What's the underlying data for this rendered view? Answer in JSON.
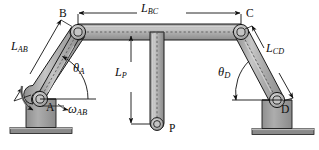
{
  "figure": {
    "type": "mechanism-diagram",
    "width": 319,
    "height": 150,
    "background": "#ffffff"
  },
  "colors": {
    "link_fill": "#a9a9a9",
    "link_highlight": "#c9c9c9",
    "link_stroke": "#1a1a1a",
    "ground_fill": "#9e9e9e",
    "ground_base": "#8a8a8a",
    "centerline": "#6b6b6b",
    "text": "#0d0d0d",
    "pin_fill": "#b5b5b5",
    "pin_inner": "#cfcfcf"
  },
  "labels": {
    "joint_a": "A",
    "joint_b": "B",
    "joint_c": "C",
    "joint_d": "D",
    "joint_p": "P",
    "length_ab": "L",
    "length_ab_sub": "AB",
    "length_bc": "L",
    "length_bc_sub": "BC",
    "length_cd": "L",
    "length_cd_sub": "CD",
    "length_p": "L",
    "length_p_sub": "P",
    "angle_a": "θ",
    "angle_a_sub": "A",
    "angle_d": "θ",
    "angle_d_sub": "D",
    "omega_ab": "ω",
    "omega_ab_sub": "AB"
  },
  "geometry": {
    "joints": [
      {
        "name": "A",
        "x": 40,
        "y": 99,
        "type": "ground-pin",
        "radius": 7.5
      },
      {
        "name": "B",
        "x": 78,
        "y": 32,
        "type": "pin",
        "radius": 7.5
      },
      {
        "name": "C",
        "x": 241,
        "y": 32,
        "type": "pin",
        "radius": 7.5
      },
      {
        "name": "D",
        "x": 277,
        "y": 100,
        "type": "ground-pin",
        "radius": 7.5
      },
      {
        "name": "P",
        "x": 157,
        "y": 130,
        "type": "point",
        "radius": 6.5
      }
    ],
    "links": [
      {
        "name": "AB",
        "from": "A",
        "to": "B",
        "half_width": 8
      },
      {
        "name": "BC",
        "from": "B",
        "to": "C",
        "half_width": 8
      },
      {
        "name": "CD",
        "from": "C",
        "to": "D",
        "half_width": 8
      },
      {
        "name": "BP",
        "from": "BC-midpoint",
        "to": "P",
        "half_width": 7
      }
    ],
    "grounds": [
      {
        "name": "ground-A",
        "x": 26,
        "y": 99,
        "width": 30,
        "height": 30
      },
      {
        "name": "ground-D",
        "x": 262,
        "y": 100,
        "width": 30,
        "height": 30
      }
    ],
    "floors": [
      {
        "name": "floor-left",
        "x": 10,
        "y": 128,
        "width": 62,
        "height": 6
      },
      {
        "name": "floor-right",
        "x": 252,
        "y": 129,
        "width": 62,
        "height": 6
      }
    ],
    "dimensions": [
      {
        "name": "L_BC",
        "orientation": "horizontal",
        "x1": 78,
        "x2": 241,
        "y": 13
      },
      {
        "name": "L_P",
        "orientation": "vertical",
        "x": 131,
        "y1": 36,
        "y2": 130
      },
      {
        "name": "L_AB",
        "orientation": "diagonal",
        "x1": 20,
        "y1": 80,
        "x2": 62,
        "y2": 18
      },
      {
        "name": "L_CD",
        "orientation": "diagonal",
        "x1": 253,
        "y1": 25,
        "x2": 294,
        "y2": 88
      }
    ],
    "angles": [
      {
        "name": "theta_A",
        "vertex": "A",
        "radius": 30,
        "label_x": 75,
        "label_y": 72
      },
      {
        "name": "theta_D",
        "vertex": "D",
        "radius": 30,
        "label_x": 223,
        "label_y": 73
      },
      {
        "name": "omega_AB",
        "vertex": "A",
        "kind": "rotation-arrow",
        "direction": "counterclockwise"
      }
    ]
  },
  "label_positions": {
    "B": {
      "x": 60,
      "y": 14
    },
    "C": {
      "x": 246,
      "y": 14
    },
    "A": {
      "x": 47,
      "y": 108
    },
    "D": {
      "x": 281,
      "y": 110
    },
    "P": {
      "x": 170,
      "y": 129
    },
    "L_AB": {
      "x": 13,
      "y": 45
    },
    "L_BC": {
      "x": 145,
      "y": 5
    },
    "L_CD": {
      "x": 267,
      "y": 46
    },
    "L_P": {
      "x": 117,
      "y": 72
    },
    "theta_A": {
      "x": 75,
      "y": 67
    },
    "theta_D": {
      "x": 220,
      "y": 70
    },
    "omega_AB": {
      "x": 68,
      "y": 106
    }
  }
}
